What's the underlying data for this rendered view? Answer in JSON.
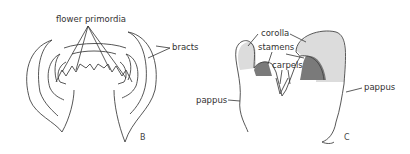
{
  "panels": [
    {
      "id": "B",
      "label": "B",
      "annotations": [
        "flower primordia",
        "bracts"
      ]
    },
    {
      "id": "C",
      "label": "C",
      "annotations": [
        "corolla",
        "stamens",
        "carpels",
        "pappus",
        "pappus"
      ]
    }
  ],
  "labels": {
    "flower_primordia": "flower primordia",
    "bracts": "bracts",
    "corolla": "corolla",
    "stamens": "stamens",
    "carpels": "carpels",
    "pappus_left": "pappus",
    "pappus_right": "pappus",
    "panel_b": "B",
    "panel_c": "C"
  },
  "colors": {
    "corolla_fill": "#dcdcdc",
    "stamen_fill": "#7a7a7a",
    "outline": "#444444"
  }
}
